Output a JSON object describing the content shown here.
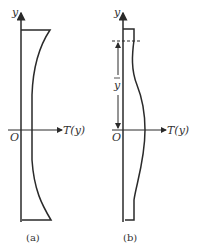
{
  "figure_a": {
    "y_axis_label": "y",
    "origin_label": "O",
    "x_axis_label": "T(y)",
    "caption": "(a)"
  },
  "figure_b": {
    "y_axis_label": "y",
    "origin_label": "O",
    "x_axis_label": "T(y)",
    "ybar_label": "y",
    "caption": "(b)"
  },
  "colors": {
    "stroke": "#2a2a2a",
    "background": "#ffffff"
  }
}
